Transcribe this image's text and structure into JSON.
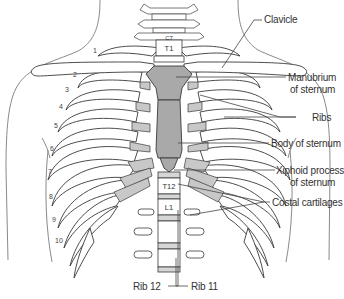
{
  "diagram": {
    "colors": {
      "bone_fill": "#ffffff",
      "cartilage_fill": "#c8c8c8",
      "sternum_fill": "#a9a9a9",
      "outline": "#3a3a3a",
      "body_outline": "#8a8a8a",
      "leader_line": "#444444",
      "text": "#333333"
    },
    "labels": [
      {
        "id": "clavicle",
        "text": "Clavicle"
      },
      {
        "id": "manubrium",
        "line1": "Manubrium",
        "line2": "of sternum"
      },
      {
        "id": "ribs",
        "text": "Ribs"
      },
      {
        "id": "body-of-sternum",
        "text": "Body of sternum"
      },
      {
        "id": "xiphoid",
        "line1": "Xiphoid process",
        "line2": "of sternum"
      },
      {
        "id": "costal-cartilages",
        "text": "Costal cartilages"
      },
      {
        "id": "rib-12",
        "text": "Rib 12"
      },
      {
        "id": "rib-11",
        "text": "Rib 11"
      }
    ],
    "vertebrae": [
      "C7",
      "T1",
      "T12",
      "L1"
    ],
    "rib_numbers": [
      "1",
      "2",
      "3",
      "4",
      "5",
      "6",
      "7",
      "8",
      "9",
      "10"
    ]
  }
}
